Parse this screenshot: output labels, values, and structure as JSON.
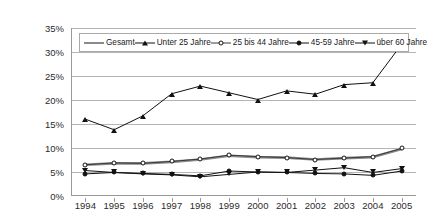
{
  "chart_data": {
    "type": "line",
    "title": "",
    "subtitle": "",
    "xlabel": "",
    "ylabel": "",
    "categories": [
      "1994",
      "1995",
      "1996",
      "1997",
      "1998",
      "1999",
      "2000",
      "2001",
      "2002",
      "2003",
      "2004",
      "2005"
    ],
    "x": [
      1994,
      1995,
      1996,
      1997,
      1998,
      1999,
      2000,
      2001,
      2002,
      2003,
      2004,
      2005
    ],
    "ylim": [
      0,
      35
    ],
    "ytick_labels": [
      "0%",
      "5%",
      "10%",
      "15%",
      "20%",
      "25%",
      "30%",
      "35%"
    ],
    "ytick_values": [
      0,
      5,
      10,
      15,
      20,
      25,
      30,
      35
    ],
    "grid": true,
    "legend_position": "top-inside",
    "value_suffix": "%",
    "series": [
      {
        "name": "Gesamt",
        "marker": "none",
        "color": "#8a8a8a",
        "width": 2.6,
        "values": [
          6.5,
          6.8,
          6.8,
          7.1,
          7.6,
          8.4,
          8.1,
          8.0,
          7.6,
          7.9,
          8.1,
          9.8
        ]
      },
      {
        "name": "Unter 25 Jahre",
        "marker": "tri-up",
        "color": "#111111",
        "width": 1.0,
        "values": [
          16.0,
          13.8,
          16.7,
          21.3,
          22.9,
          21.5,
          20.1,
          21.9,
          21.2,
          23.2,
          23.6,
          31.6
        ]
      },
      {
        "name": "25 bis 44 Jahre",
        "marker": "circle",
        "color": "#3a3a3a",
        "width": 1.0,
        "values": [
          6.5,
          6.9,
          6.8,
          7.2,
          7.7,
          8.5,
          8.2,
          8.0,
          7.6,
          7.9,
          8.2,
          9.9
        ]
      },
      {
        "name": "45-59 Jahre",
        "marker": "dot",
        "color": "#111111",
        "width": 1.0,
        "values": [
          4.6,
          4.9,
          4.7,
          4.5,
          4.2,
          5.2,
          5.0,
          4.9,
          4.7,
          4.6,
          4.3,
          5.2
        ]
      },
      {
        "name": "über 60 Jahre",
        "marker": "tri-down",
        "color": "#111111",
        "width": 1.0,
        "values": [
          5.3,
          4.9,
          4.6,
          4.4,
          4.0,
          4.5,
          5.0,
          4.9,
          5.4,
          5.9,
          4.9,
          5.7
        ]
      }
    ]
  }
}
